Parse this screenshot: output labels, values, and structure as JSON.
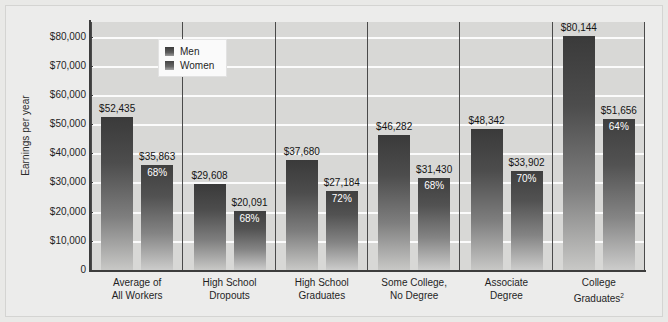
{
  "chart_data": {
    "type": "bar",
    "title": "",
    "xlabel": "",
    "ylabel": "Earnings per year",
    "ylim": [
      0,
      85000
    ],
    "grid": true,
    "legend_position": "top-left-inside",
    "categories": [
      "Average of\nAll Workers",
      "High School\nDropouts",
      "High School\nGraduates",
      "Some College,\nNo Degree",
      "Associate\nDegree",
      "College\nGraduates"
    ],
    "category_lines": [
      [
        "Average of",
        "All Workers"
      ],
      [
        "High School",
        "Dropouts"
      ],
      [
        "High School",
        "Graduates"
      ],
      [
        "Some College,",
        "No Degree"
      ],
      [
        "Associate",
        "Degree"
      ],
      [
        "College",
        "Graduates"
      ]
    ],
    "category_footnote_index": 5,
    "category_footnote_marker": "2",
    "tick_labels": [
      "0",
      "$10,000",
      "$20,000",
      "$30,000",
      "$40,000",
      "$50,000",
      "$60,000",
      "$70,000",
      "$80,000"
    ],
    "tick_values": [
      0,
      10000,
      20000,
      30000,
      40000,
      50000,
      60000,
      70000,
      80000
    ],
    "series": [
      {
        "name": "Men",
        "values": [
          52435,
          29608,
          37680,
          46282,
          48342,
          80144
        ],
        "value_labels": [
          "$52,435",
          "$29,608",
          "$37,680",
          "$46,282",
          "$48,342",
          "$80,144"
        ],
        "pct_labels": [
          "",
          "",
          "",
          "",
          "",
          ""
        ]
      },
      {
        "name": "Women",
        "values": [
          35863,
          20091,
          27184,
          31430,
          33902,
          51656
        ],
        "value_labels": [
          "$35,863",
          "$20,091",
          "$27,184",
          "$31,430",
          "$33,902",
          "$51,656"
        ],
        "pct_labels": [
          "68%",
          "68%",
          "72%",
          "68%",
          "70%",
          "64%"
        ]
      }
    ]
  },
  "legend": {
    "items": [
      {
        "label": "Men"
      },
      {
        "label": "Women"
      }
    ]
  },
  "colors": {
    "bar_top": "#3a3a3a",
    "bar_bottom": "#c8c8c6",
    "plot_background": "#d8d8d6",
    "gridline": "#fbfbfb",
    "axis": "#3d3d3d",
    "page_background": "#ececeb",
    "text": "#1f1f1f",
    "pct_text": "#ffffff"
  }
}
